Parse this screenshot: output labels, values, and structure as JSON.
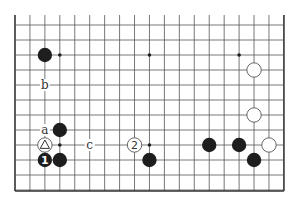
{
  "board": {
    "origin_x": 15,
    "origin_y": 25,
    "step": 14.94,
    "columns": 19,
    "rows": 12,
    "top_y": 15,
    "bottom_border_y": 191,
    "colors": {
      "black": "#1e1e1e",
      "white": "#ffffff",
      "line": "#555555"
    }
  },
  "star_points": [
    {
      "col": 3,
      "row": 2
    },
    {
      "col": 9,
      "row": 2
    },
    {
      "col": 15,
      "row": 2
    },
    {
      "col": 3,
      "row": 8
    },
    {
      "col": 9,
      "row": 8
    }
  ],
  "stones": [
    {
      "color": "black",
      "col": 2,
      "row": 2
    },
    {
      "color": "white",
      "col": 16,
      "row": 3
    },
    {
      "color": "white",
      "col": 16,
      "row": 6
    },
    {
      "color": "black",
      "col": 3,
      "row": 7
    },
    {
      "color": "white",
      "col": 2,
      "row": 8,
      "marker": "triangle"
    },
    {
      "color": "white",
      "col": 8,
      "row": 8,
      "number": "2"
    },
    {
      "color": "black",
      "col": 13,
      "row": 8
    },
    {
      "color": "black",
      "col": 15,
      "row": 8
    },
    {
      "color": "white",
      "col": 17,
      "row": 8
    },
    {
      "color": "black",
      "col": 2,
      "row": 9,
      "number": "1"
    },
    {
      "color": "black",
      "col": 3,
      "row": 9
    },
    {
      "color": "black",
      "col": 9,
      "row": 9
    },
    {
      "color": "black",
      "col": 16,
      "row": 9
    }
  ],
  "labels": [
    {
      "text": "b",
      "col": 2,
      "row": 4
    },
    {
      "text": "a",
      "col": 2,
      "row": 7
    },
    {
      "text": "c",
      "col": 5,
      "row": 8
    }
  ]
}
